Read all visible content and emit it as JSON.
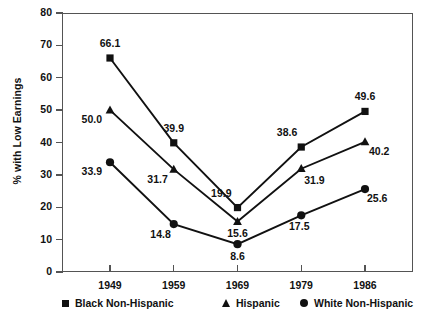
{
  "chart_data": {
    "type": "line",
    "title": "",
    "xlabel": "",
    "ylabel": "% with Low Earnings",
    "categories": [
      "1949",
      "1959",
      "1969",
      "1979",
      "1986"
    ],
    "xticklabels": [
      "1949",
      "1959",
      "1969",
      "1979",
      "1986"
    ],
    "yticklabels": [
      "0",
      "10",
      "20",
      "30",
      "40",
      "50",
      "60",
      "70",
      "80"
    ],
    "ylim": [
      0,
      80
    ],
    "ytick_step": 10,
    "grid": false,
    "legend_position": "below",
    "series": [
      {
        "name": "Black Non-Hispanic",
        "marker": "square",
        "values": [
          66.1,
          39.9,
          19.9,
          38.6,
          49.6
        ],
        "labels": [
          "66.1",
          "39.9",
          "19.9",
          "38.6",
          "49.6"
        ]
      },
      {
        "name": "Hispanic",
        "marker": "triangle",
        "values": [
          50.0,
          31.7,
          15.6,
          31.9,
          40.2
        ],
        "labels": [
          "50.0",
          "31.7",
          "15.6",
          "31.9",
          "40.2"
        ]
      },
      {
        "name": "White Non-Hispanic",
        "marker": "circle",
        "values": [
          33.9,
          14.8,
          8.6,
          17.5,
          25.6
        ],
        "labels": [
          "33.9",
          "14.8",
          "8.6",
          "17.5",
          "25.6"
        ]
      }
    ],
    "colors": {
      "line": "#111111",
      "marker": "#111111",
      "axis": "#545454",
      "text": "#111111",
      "background": "#ffffff"
    }
  },
  "legend": {
    "items": [
      {
        "label": "Black Non-Hispanic",
        "marker": "square-marker"
      },
      {
        "label": "Hispanic",
        "marker": "triangle-marker"
      },
      {
        "label": "White Non-Hispanic",
        "marker": "circle-marker"
      }
    ]
  }
}
